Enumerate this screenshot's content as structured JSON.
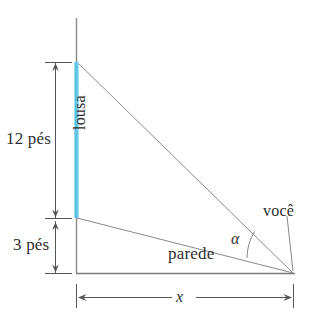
{
  "figure": {
    "labels": {
      "height_board": "12 pés",
      "height_below": "3 pés",
      "board": "lousa",
      "wall": "parede",
      "observer": "você",
      "angle": "α",
      "distance": "x"
    },
    "colors": {
      "board": "#5cc3e4",
      "line": "#8a8a8a",
      "baseline": "#7a7a7a",
      "text": "#2f2f2f",
      "background": "#ffffff"
    },
    "geometry": {
      "wall_x": 76,
      "wall_top_y": 18,
      "board_top_y": 62,
      "board_bottom_y": 218,
      "baseline_y": 273,
      "apex_x": 293,
      "apex_y": 273,
      "dimension_line_x": 55,
      "dimension_bottom_y": 300
    },
    "values": {
      "board_height_feet": 12,
      "board_bottom_height_feet": 3,
      "distance_symbol": "x",
      "angle_symbol": "alpha"
    }
  }
}
